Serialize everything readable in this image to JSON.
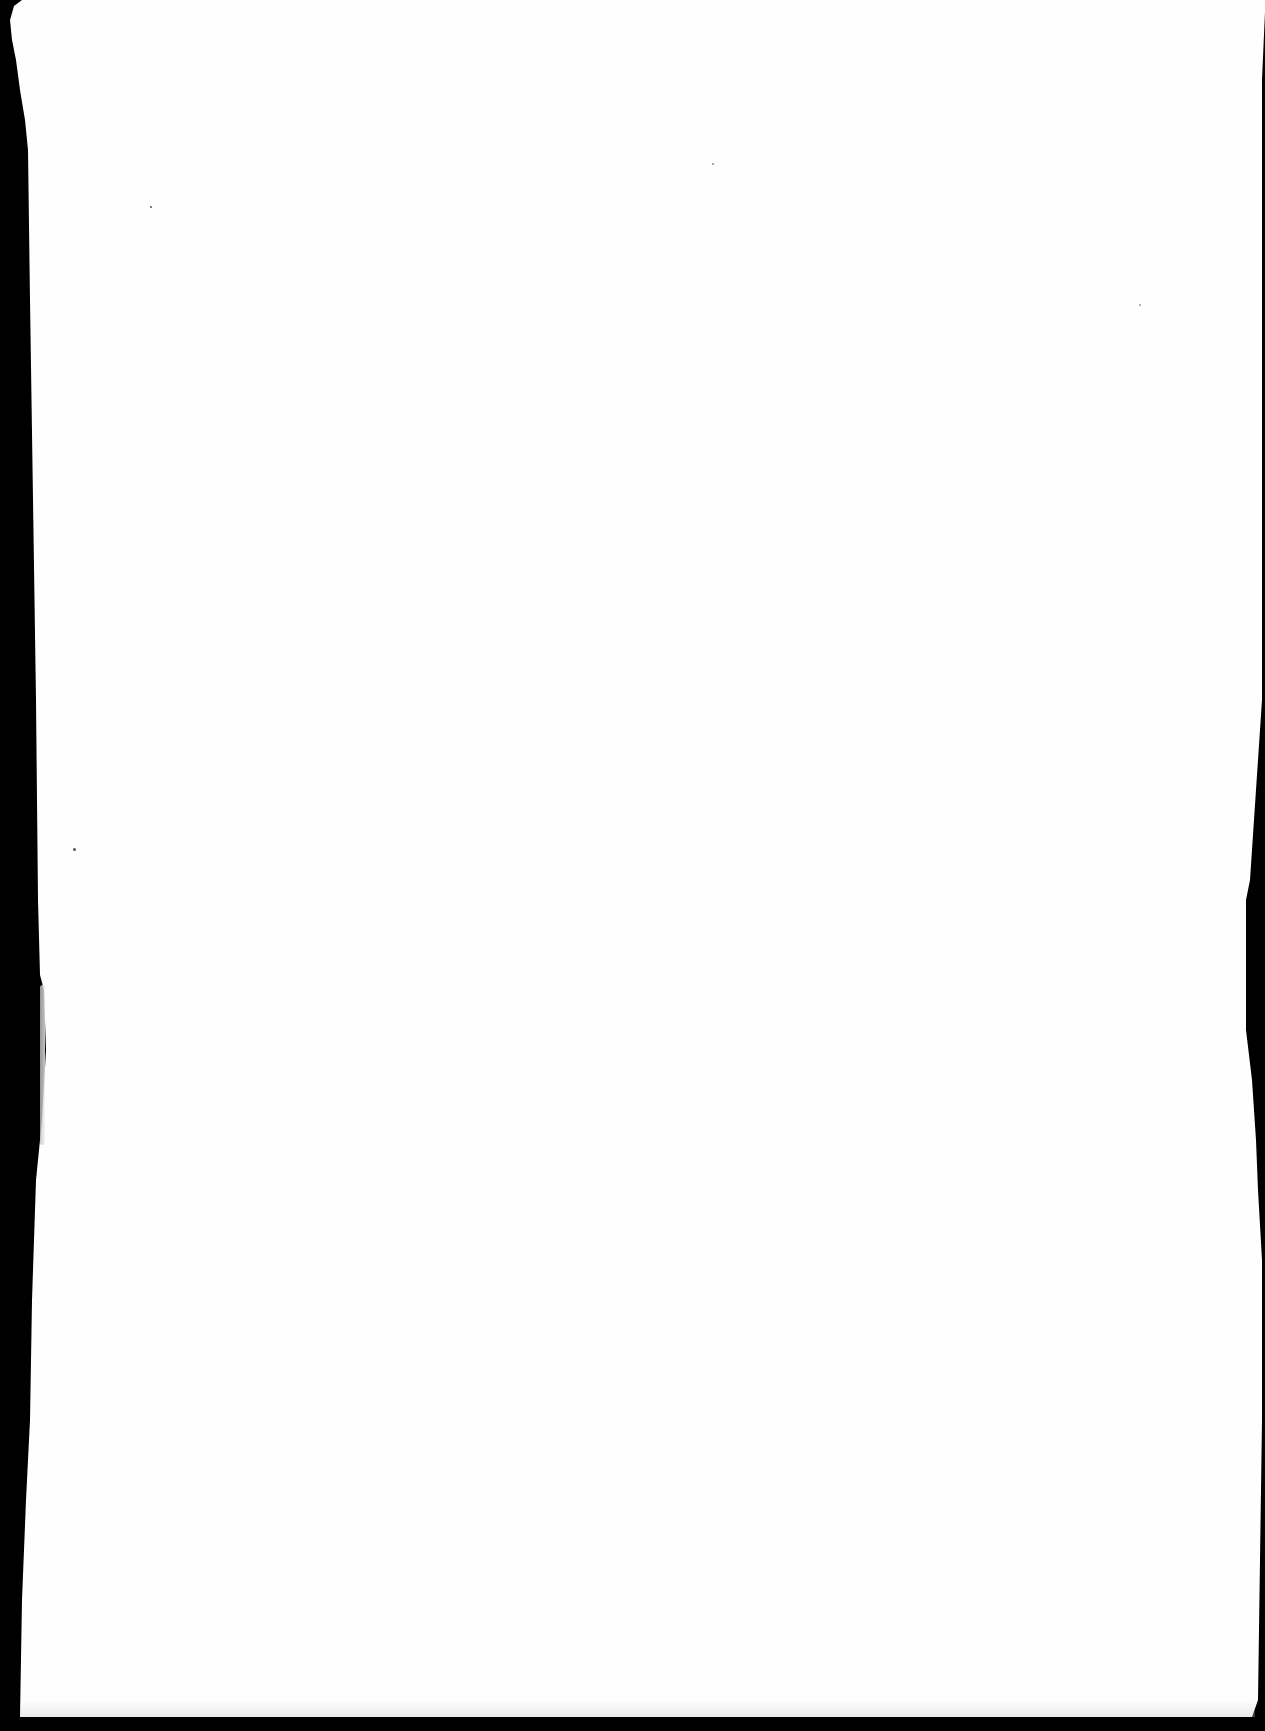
{
  "page": {
    "type": "blank scanned page",
    "text_content": "",
    "background_color": "#fefefe",
    "border_color": "#000000"
  }
}
